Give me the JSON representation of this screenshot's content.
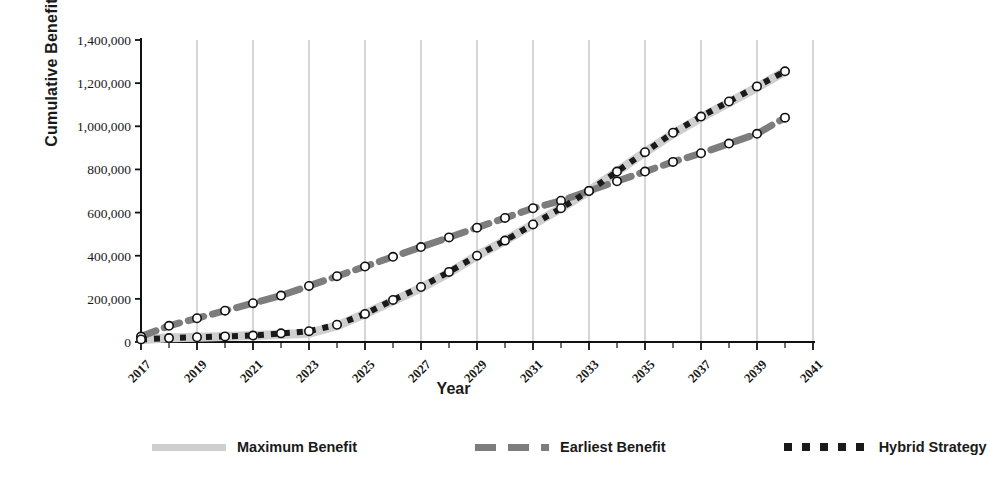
{
  "chart_data": {
    "type": "line",
    "title": "",
    "xlabel": "Year",
    "ylabel": "Cumulative Benefit ($)",
    "xlim": [
      2017,
      2041
    ],
    "ylim": [
      0,
      1400000
    ],
    "grid": "vertical",
    "legend_position": "bottom",
    "ytick_labels": [
      "1,400,000",
      "1,200,000",
      "1,000,000",
      "800,000",
      "600,000",
      "400,000",
      "200,000",
      "0"
    ],
    "ytick_values": [
      1400000,
      1200000,
      1000000,
      800000,
      600000,
      400000,
      200000,
      0
    ],
    "xtick_labels": [
      "2017",
      "2019",
      "2021",
      "2023",
      "2025",
      "2027",
      "2029",
      "2031",
      "2033",
      "2035",
      "2037",
      "2039",
      "2041"
    ],
    "xtick_values": [
      2017,
      2019,
      2021,
      2023,
      2025,
      2027,
      2029,
      2031,
      2033,
      2035,
      2037,
      2039,
      2041
    ],
    "x": [
      2017,
      2018,
      2019,
      2020,
      2021,
      2022,
      2023,
      2024,
      2025,
      2026,
      2027,
      2028,
      2029,
      2030,
      2031,
      2032,
      2033,
      2034,
      2035,
      2036,
      2037,
      2038,
      2039,
      2040
    ],
    "series": [
      {
        "name": "Maximum Benefit",
        "style": "solid",
        "color": "#cfcfcf",
        "values": [
          10000,
          20000,
          22000,
          25000,
          30000,
          35000,
          40000,
          75000,
          130000,
          190000,
          250000,
          320000,
          400000,
          470000,
          545000,
          620000,
          700000,
          790000,
          880000,
          965000,
          1040000,
          1110000,
          1180000,
          1255000
        ]
      },
      {
        "name": "Earliest Benefit",
        "style": "dashed",
        "color": "#7d7d7d",
        "values": [
          25000,
          75000,
          110000,
          145000,
          180000,
          215000,
          260000,
          305000,
          350000,
          395000,
          440000,
          485000,
          530000,
          575000,
          620000,
          655000,
          700000,
          745000,
          790000,
          835000,
          875000,
          920000,
          965000,
          1040000
        ]
      },
      {
        "name": "Hybrid Strategy",
        "style": "dotted",
        "color": "#1a1a1a",
        "values": [
          12000,
          18000,
          22000,
          26000,
          30000,
          40000,
          50000,
          80000,
          130000,
          195000,
          255000,
          325000,
          400000,
          470000,
          545000,
          620000,
          700000,
          790000,
          880000,
          970000,
          1045000,
          1115000,
          1185000,
          1255000
        ]
      }
    ]
  },
  "legend": {
    "items": [
      {
        "label": "Maximum Benefit",
        "swatch": "solid-line-swatch"
      },
      {
        "label": "Earliest Benefit",
        "swatch": "dashed-line-swatch"
      },
      {
        "label": "Hybrid Strategy",
        "swatch": "dotted-line-swatch"
      }
    ]
  },
  "axes": {
    "y_title": "Cumulative Benefit ($)",
    "x_title": "Year"
  }
}
